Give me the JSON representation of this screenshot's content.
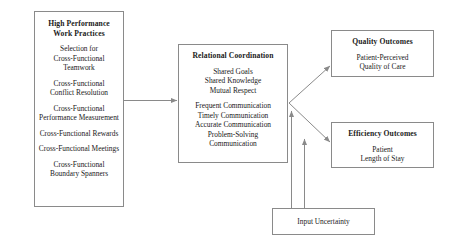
{
  "diagram": {
    "type": "flow-model",
    "line_color": "#8a8a8a",
    "text_color": "#1a1a1a",
    "background": "#ffffff"
  },
  "boxes": {
    "hpwp": {
      "title": "High Performance\nWork Practices",
      "title_line1": "High Performance",
      "title_line2": "Work Practices",
      "groups": [
        [
          "Selection for",
          "Cross-Functional",
          "Teamwork"
        ],
        [
          "Cross-Functional",
          "Conflict Resolution"
        ],
        [
          "Cross-Functional",
          "Performance Measurement"
        ],
        [
          "Cross-Functional Rewards"
        ],
        [
          "Cross-Functional Meetings"
        ],
        [
          "Cross-Functional",
          "Boundary Spanners"
        ]
      ]
    },
    "relational_coordination": {
      "title": "Relational Coordination",
      "groups": [
        [
          "Shared Goals",
          "Shared Knowledge",
          "Mutual Respect"
        ],
        [
          "Frequent Communication",
          "Timely Communication",
          "Accurate Communication",
          "Problem-Solving",
          "Communication"
        ]
      ]
    },
    "quality_outcomes": {
      "title": "Quality Outcomes",
      "groups": [
        [
          "Patient-Perceived",
          "Quality of Care"
        ]
      ]
    },
    "efficiency_outcomes": {
      "title": "Efficiency Outcomes",
      "groups": [
        [
          "Patient",
          "Length of Stay"
        ]
      ]
    },
    "input_uncertainty": {
      "title": "Input Uncertainty",
      "groups": []
    }
  },
  "arrows": [
    {
      "name": "hpwp-to-relational-coordination",
      "from": "hpwp",
      "to": "relational_coordination",
      "style": "horizontal"
    },
    {
      "name": "relational-coordination-to-quality",
      "from": "relational_coordination",
      "to": "quality_outcomes",
      "style": "diagonal-up"
    },
    {
      "name": "relational-coordination-to-efficiency",
      "from": "relational_coordination",
      "to": "efficiency_outcomes",
      "style": "diagonal-down"
    },
    {
      "name": "input-uncertainty-to-relational-coordination",
      "from": "input_uncertainty",
      "to": "relational_coordination",
      "style": "vertical"
    },
    {
      "name": "input-uncertainty-to-efficiency",
      "from": "input_uncertainty",
      "to": "efficiency_outcomes",
      "style": "vertical"
    }
  ]
}
